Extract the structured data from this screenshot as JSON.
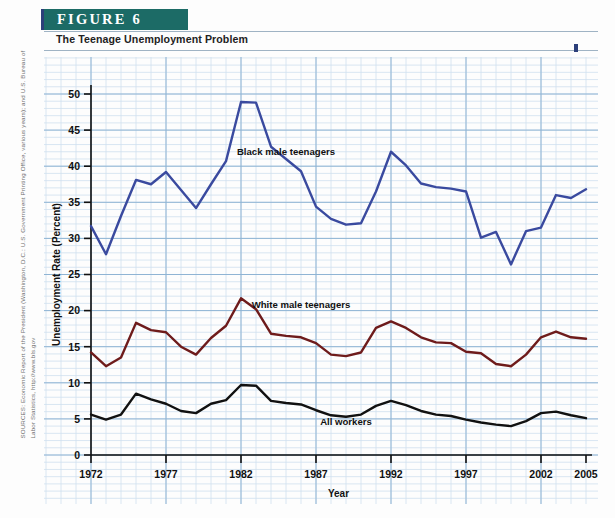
{
  "figure": {
    "banner_label": "FIGURE  6",
    "subtitle": "The Teenage Unemployment Problem",
    "banner_color": "#1c6b66",
    "accent_color": "#2c3f7a"
  },
  "source": {
    "line1": "SOURCES: Economic Report of the President (Washington, D.C.: U.S. Government Printing Office, various years); and U.S. Bureau of",
    "line2": "Labor Statistics, http://www.bls.gov"
  },
  "chart_data": {
    "type": "line",
    "title": "The Teenage Unemployment Problem",
    "xlabel": "Year",
    "ylabel": "Unemployment Rate (Percent)",
    "xlim": [
      1972,
      2005
    ],
    "ylim": [
      0,
      50
    ],
    "grid": true,
    "legend": "inline-annotations",
    "x": [
      1972,
      1973,
      1974,
      1975,
      1976,
      1977,
      1978,
      1979,
      1980,
      1981,
      1982,
      1983,
      1984,
      1985,
      1986,
      1987,
      1988,
      1989,
      1990,
      1991,
      1992,
      1993,
      1994,
      1995,
      1996,
      1997,
      1998,
      1999,
      2000,
      2001,
      2002,
      2003,
      2004,
      2005
    ],
    "xticks": [
      1972,
      1977,
      1982,
      1987,
      1992,
      1997,
      2002,
      2005
    ],
    "yticks": [
      0,
      5,
      10,
      15,
      20,
      25,
      30,
      35,
      40,
      45,
      50
    ],
    "series": [
      {
        "name": "Black male teenagers",
        "color": "#3a4a9f",
        "label_x": 1985,
        "label_y": 41.5,
        "values": [
          31.7,
          27.8,
          33.1,
          38.1,
          37.5,
          39.2,
          36.7,
          34.2,
          37.5,
          40.7,
          48.9,
          48.8,
          42.7,
          41.0,
          39.3,
          34.4,
          32.7,
          31.9,
          32.1,
          36.5,
          42.0,
          40.1,
          37.6,
          37.1,
          36.9,
          36.5,
          30.1,
          30.9,
          26.4,
          31.0,
          31.5,
          36.0,
          35.6,
          36.8
        ]
      },
      {
        "name": "White male teenagers",
        "color": "#6e1b1b",
        "label_x": 1986,
        "label_y": 20.4,
        "values": [
          14.2,
          12.3,
          13.5,
          18.3,
          17.3,
          17.0,
          15.0,
          13.9,
          16.2,
          17.9,
          21.7,
          20.2,
          16.8,
          16.5,
          16.3,
          15.5,
          13.9,
          13.7,
          14.2,
          17.6,
          18.5,
          17.6,
          16.3,
          15.6,
          15.5,
          14.3,
          14.1,
          12.6,
          12.3,
          13.9,
          16.3,
          17.1,
          16.3,
          16.1
        ]
      },
      {
        "name": "All workers",
        "color": "#111111",
        "label_x": 1989,
        "label_y": 4.2,
        "values": [
          5.6,
          4.9,
          5.6,
          8.5,
          7.7,
          7.1,
          6.1,
          5.8,
          7.1,
          7.6,
          9.7,
          9.6,
          7.5,
          7.2,
          7.0,
          6.2,
          5.5,
          5.3,
          5.6,
          6.8,
          7.5,
          6.9,
          6.1,
          5.6,
          5.4,
          4.9,
          4.5,
          4.2,
          4.0,
          4.7,
          5.8,
          6.0,
          5.5,
          5.1
        ]
      }
    ]
  }
}
